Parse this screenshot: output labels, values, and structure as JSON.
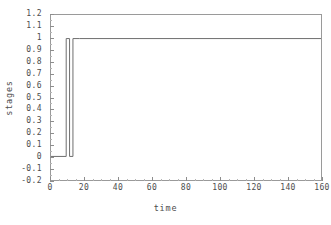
{
  "chart_data": {
    "type": "line",
    "title": "",
    "xlabel": "time",
    "ylabel": "stages",
    "xlim": [
      0,
      160
    ],
    "ylim": [
      -0.2,
      1.2
    ],
    "grid": false,
    "legend": null,
    "line_color": "#6e6e6e",
    "axis_color": "#9a9a9a",
    "background": "#ffffff",
    "x_ticks": [
      0,
      20,
      40,
      60,
      80,
      100,
      120,
      140,
      160
    ],
    "x_tick_labels": [
      "0",
      "20",
      "40",
      "60",
      "80",
      "100",
      "120",
      "140",
      "160"
    ],
    "x_minor_tick_step": 5,
    "y_ticks": [
      -0.2,
      -0.1,
      0,
      0.1,
      0.2,
      0.3,
      0.4,
      0.5,
      0.6,
      0.7,
      0.8,
      0.9,
      1,
      1.1,
      1.2
    ],
    "y_tick_labels": [
      "-0.2",
      "-0.1",
      "0",
      "0.1",
      "0.2",
      "0.3",
      "0.4",
      "0.5",
      "0.6",
      "0.7",
      "0.8",
      "0.9",
      "1",
      "1.1",
      "1.2"
    ],
    "series": [
      {
        "name": "stages",
        "step": "post",
        "x": [
          0,
          9,
          9,
          11,
          11,
          13,
          13,
          17,
          17,
          160
        ],
        "values": [
          0,
          0,
          1,
          1,
          0,
          0,
          1,
          1,
          1,
          1
        ]
      }
    ]
  }
}
